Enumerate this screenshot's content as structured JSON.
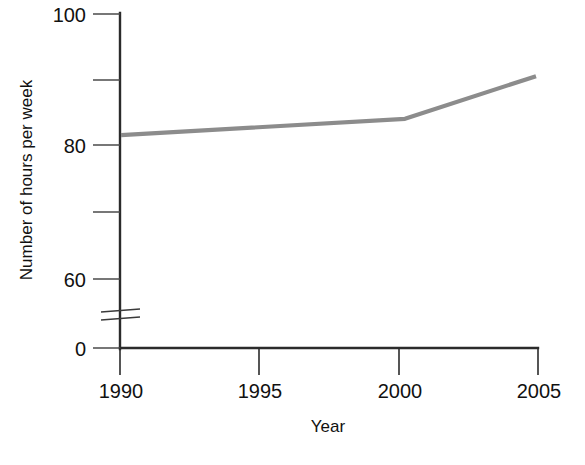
{
  "chart_data": {
    "type": "line",
    "title": "",
    "xlabel": "Year",
    "ylabel": "Number of hours per week",
    "x": [
      1990,
      2000,
      2005
    ],
    "values": [
      81.5,
      84.0,
      90.5
    ],
    "series": [
      {
        "name": "Number of hours per week",
        "x": [
          1990,
          2000,
          2005
        ],
        "values": [
          81.5,
          84.0,
          90.5
        ],
        "color": "#8c8c8c"
      }
    ],
    "x_tick_labels": [
      "1990",
      "1995",
      "2000",
      "2005"
    ],
    "x_tick_values": [
      1990,
      1995,
      2000,
      2005
    ],
    "xlim": [
      1990,
      2005
    ],
    "y_tick_labels": [
      "0",
      "60",
      "80",
      "100"
    ],
    "y_tick_values": [
      0,
      60,
      80,
      100
    ],
    "y_minor_tick_values": [
      70,
      90
    ],
    "ylim": [
      0,
      100
    ],
    "y_axis_break": true,
    "y_axis_break_between": [
      0,
      60
    ],
    "grid": false,
    "legend": false,
    "legend_position": "none"
  },
  "labels": {
    "y_100": "100",
    "y_80": "80",
    "y_60": "60",
    "y_0": "0",
    "x_1990": "1990",
    "x_1995": "1995",
    "x_2000": "2000",
    "x_2005": "2005",
    "x_axis_title": "Year",
    "y_axis_title": "Number of hours per week"
  },
  "colors": {
    "line": "#8c8c8c",
    "axis": "#2b2b2b",
    "background": "#ffffff",
    "text": "#111111"
  }
}
